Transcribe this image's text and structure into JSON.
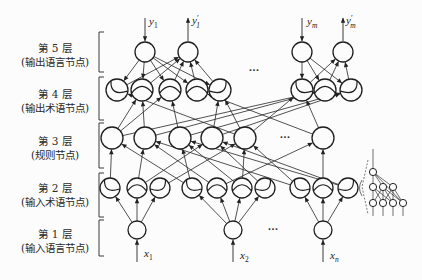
{
  "layer_labels": [
    {
      "title": "第 5 层",
      "desc": "(输出语言节点)"
    },
    {
      "title": "第 4 层",
      "desc": "(输出术语节点)"
    },
    {
      "title": "第 3 层",
      "desc": "(规则节点)"
    },
    {
      "title": "第 2 层",
      "desc": "(输入术语节点)"
    },
    {
      "title": "第 1 层",
      "desc": "(输入语言节点)"
    }
  ],
  "ellipsis_text": "···",
  "diagram": {
    "layers": [
      {
        "key": "L5",
        "name": "output-linguistic-node",
        "y": 52,
        "r": 10,
        "xs": [
          145,
          188,
          302,
          343
        ]
      },
      {
        "key": "L4",
        "name": "output-term-node",
        "y": 90,
        "r": 11,
        "xs": [
          117,
          142,
          170,
          197,
          220,
          302,
          325,
          351
        ],
        "arcs": [
          "l",
          "m",
          "m",
          "m",
          "r",
          "l",
          "m",
          "r"
        ]
      },
      {
        "key": "L3",
        "name": "rule-node",
        "y": 138,
        "r": 11,
        "xs": [
          112,
          145,
          180,
          212,
          245,
          323
        ]
      },
      {
        "key": "L2",
        "name": "input-term-node",
        "y": 188,
        "r": 10,
        "xs": [
          110,
          137,
          160,
          192,
          217,
          242,
          265,
          300,
          323,
          348
        ],
        "arcs": [
          "l",
          "m",
          "r",
          "l",
          "m",
          "m",
          "r",
          "l",
          "m",
          "r"
        ]
      },
      {
        "key": "L1",
        "name": "input-linguistic-node",
        "y": 230,
        "r": 9,
        "xs": [
          137,
          233,
          323
        ]
      }
    ],
    "edges": [
      [
        "L1.0",
        "L2.0"
      ],
      [
        "L1.0",
        "L2.1"
      ],
      [
        "L1.0",
        "L2.2"
      ],
      [
        "L1.1",
        "L2.3"
      ],
      [
        "L1.1",
        "L2.4"
      ],
      [
        "L1.1",
        "L2.5"
      ],
      [
        "L1.1",
        "L2.6"
      ],
      [
        "L1.2",
        "L2.7"
      ],
      [
        "L1.2",
        "L2.8"
      ],
      [
        "L1.2",
        "L2.9"
      ],
      [
        "L2.0",
        "L3.0"
      ],
      [
        "L2.1",
        "L3.1"
      ],
      [
        "L2.1",
        "L3.3"
      ],
      [
        "L2.2",
        "L3.4"
      ],
      [
        "L2.3",
        "L3.0"
      ],
      [
        "L2.3",
        "L3.2"
      ],
      [
        "L2.4",
        "L3.1"
      ],
      [
        "L2.4",
        "L3.5"
      ],
      [
        "L2.5",
        "L3.2"
      ],
      [
        "L2.5",
        "L3.4"
      ],
      [
        "L2.6",
        "L3.3"
      ],
      [
        "L2.7",
        "L3.1"
      ],
      [
        "L2.7",
        "L3.4"
      ],
      [
        "L2.8",
        "L3.5"
      ],
      [
        "L2.9",
        "L3.2"
      ],
      [
        "L2.9",
        "L3.3"
      ],
      [
        "L3.0",
        "L4.1"
      ],
      [
        "L3.0",
        "L4.2"
      ],
      [
        "L3.0",
        "L4.6"
      ],
      [
        "L3.1",
        "L4.1"
      ],
      [
        "L3.1",
        "L4.6"
      ],
      [
        "L3.2",
        "L4.2"
      ],
      [
        "L3.2",
        "L4.7"
      ],
      [
        "L3.3",
        "L4.7"
      ],
      [
        "L3.3",
        "L4.4"
      ],
      [
        "L3.4",
        "L4.0"
      ],
      [
        "L3.4",
        "L4.4"
      ],
      [
        "L3.4",
        "L4.5"
      ],
      [
        "L3.5",
        "L4.3"
      ],
      [
        "L3.5",
        "L4.5"
      ],
      [
        "L5.0",
        "L4.0"
      ],
      [
        "L5.0",
        "L4.1"
      ],
      [
        "L5.0",
        "L4.2"
      ],
      [
        "L5.0",
        "L4.3"
      ],
      [
        "L5.0",
        "L4.4"
      ],
      [
        "L4.0",
        "L5.1"
      ],
      [
        "L4.1",
        "L5.1"
      ],
      [
        "L4.2",
        "L5.1"
      ],
      [
        "L4.3",
        "L5.1"
      ],
      [
        "L4.4",
        "L5.1"
      ],
      [
        "L5.2",
        "L4.5"
      ],
      [
        "L5.2",
        "L4.6"
      ],
      [
        "L5.2",
        "L4.7"
      ],
      [
        "L4.5",
        "L5.3"
      ],
      [
        "L4.6",
        "L5.3"
      ],
      [
        "L4.7",
        "L5.3"
      ]
    ],
    "outputs": [
      {
        "x": 145,
        "from": 18,
        "to": 41,
        "var": "y",
        "sub": "1",
        "prime": false,
        "lx": 149,
        "ly": 25
      },
      {
        "x": 188,
        "from": 41,
        "to": 18,
        "var": "y",
        "sub": "1",
        "prime": true,
        "lx": 192,
        "ly": 24
      },
      {
        "x": 302,
        "from": 18,
        "to": 41,
        "var": "y",
        "sub": "m",
        "prime": false,
        "lx": 307,
        "ly": 25
      },
      {
        "x": 343,
        "from": 41,
        "to": 18,
        "var": "y",
        "sub": "m",
        "prime": true,
        "lx": 346,
        "ly": 24
      }
    ],
    "inputs": [
      {
        "x": 137,
        "from": 262,
        "to": 240,
        "var": "x",
        "sub": "1",
        "prime": false,
        "lx": 144,
        "ly": 257
      },
      {
        "x": 233,
        "from": 262,
        "to": 240,
        "var": "x",
        "sub": "2",
        "prime": false,
        "lx": 240,
        "ly": 259
      },
      {
        "x": 323,
        "from": 262,
        "to": 240,
        "var": "x",
        "sub": "n",
        "prime": false,
        "lx": 330,
        "ly": 259
      }
    ],
    "ellipses": [
      {
        "x": 254,
        "y": 73
      },
      {
        "x": 285,
        "y": 140
      },
      {
        "x": 273,
        "y": 232
      }
    ],
    "bracket": {
      "x": 99,
      "tick": 5,
      "segments": [
        [
          32,
          72
        ],
        [
          77,
          120
        ],
        [
          123,
          168
        ],
        [
          173,
          217
        ],
        [
          220,
          256
        ]
      ]
    },
    "inset": {
      "r": 3.6,
      "stem": [
        373,
        149,
        373,
        168
      ],
      "top": [
        373,
        172
      ],
      "mid": [
        [
          373,
          187
        ],
        [
          383,
          187
        ],
        [
          393,
          187
        ]
      ],
      "bottom": [
        [
          373,
          203
        ],
        [
          383,
          203
        ],
        [
          393,
          203
        ],
        [
          403,
          203
        ]
      ],
      "tail": 216,
      "top_edges": [
        0,
        1,
        2
      ],
      "extra_top_edges": [
        [
          403,
          203
        ]
      ],
      "mid_edges": [
        [
          0,
          0
        ],
        [
          0,
          1
        ],
        [
          0,
          2
        ],
        [
          1,
          0
        ],
        [
          1,
          1
        ],
        [
          1,
          2
        ],
        [
          1,
          3
        ],
        [
          2,
          1
        ],
        [
          2,
          2
        ],
        [
          2,
          3
        ]
      ],
      "dash": "368,160 362,187 368,214",
      "paren": "M362,180 Q357,188 362,196"
    }
  }
}
